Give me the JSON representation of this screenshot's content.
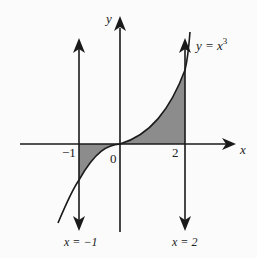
{
  "diagram": {
    "axes": {
      "x_label": "x",
      "y_label": "y"
    },
    "ticks": {
      "neg_one": "−1",
      "zero": "0",
      "two": "2"
    },
    "curve": {
      "label_lhs": "y = x",
      "label_exp": "3",
      "equation": "y = x^3"
    },
    "boundaries": [
      {
        "label": "x = −1",
        "value": -1
      },
      {
        "label": "x = 2",
        "value": 2
      }
    ],
    "colors": {
      "line": "#1a1a1a",
      "fill": "#8c8c8c",
      "background": "#fbfbfb"
    }
  }
}
